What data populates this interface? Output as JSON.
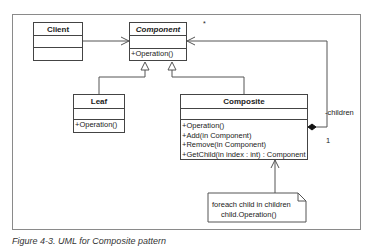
{
  "diagram": {
    "type": "UML class diagram",
    "classes": {
      "client": {
        "name": "Client",
        "operations": []
      },
      "component": {
        "name": "Component",
        "abstract": true,
        "operations": [
          "+Operation()"
        ]
      },
      "leaf": {
        "name": "Leaf",
        "operations": [
          "+Operation()"
        ]
      },
      "composite": {
        "name": "Composite",
        "operations": [
          "+Operation()",
          "+Add(in Component)",
          "+Remove(in Component)",
          "+GetChild(in index : int) : Component"
        ]
      }
    },
    "relationships": [
      {
        "from": "Client",
        "to": "Component",
        "type": "association"
      },
      {
        "from": "Leaf",
        "to": "Component",
        "type": "generalization"
      },
      {
        "from": "Composite",
        "to": "Component",
        "type": "generalization"
      },
      {
        "from": "Composite",
        "to": "Component",
        "type": "aggregation",
        "role": "children",
        "multiplicity_source": "1",
        "multiplicity_target": "*"
      }
    ],
    "labels": {
      "multiplicity_many": "*",
      "role_children": "-children",
      "multiplicity_one": "1"
    },
    "note": {
      "line1": "foreach child in children",
      "line2": "child.Operation()"
    },
    "caption": "Figure 4-3. UML for Composite pattern"
  }
}
